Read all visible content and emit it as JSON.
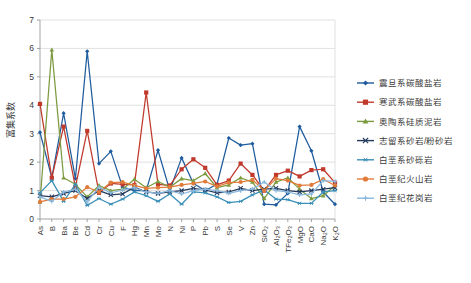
{
  "chart_data": {
    "type": "line",
    "title": "",
    "xlabel": "",
    "ylabel": "富集系数",
    "ylim": [
      0,
      7
    ],
    "ytick_labels": [
      "0",
      "1",
      "2",
      "3",
      "4",
      "5",
      "6",
      "7"
    ],
    "grid": true,
    "legend_position": "right",
    "categories": [
      "As",
      "B",
      "Ba",
      "Be",
      "Cd",
      "Cr",
      "Cu",
      "F",
      "Hg",
      "Mn",
      "Mo",
      "N",
      "Ni",
      "P",
      "Pb",
      "S",
      "Se",
      "V",
      "Zn",
      "SiO₂",
      "Al₂O₃",
      "TFe₂O₃",
      "MgO",
      "CaO",
      "Na₂O",
      "K₂O"
    ],
    "series": [
      {
        "name": "震旦系碳酸盐岩",
        "color": "#1F5C9E",
        "marker": "diamond",
        "values": [
          3.05,
          1.45,
          3.72,
          1.42,
          5.9,
          1.95,
          2.38,
          1.12,
          1.0,
          1.0,
          2.42,
          1.0,
          2.15,
          1.25,
          1.0,
          1.22,
          2.85,
          2.6,
          2.65,
          0.52,
          0.5,
          0.9,
          3.25,
          2.4,
          0.95,
          0.52
        ]
      },
      {
        "name": "寒武系碳酸盐岩",
        "color": "#C0392B",
        "marker": "square",
        "values": [
          4.05,
          1.45,
          3.25,
          1.12,
          3.1,
          0.92,
          1.25,
          1.22,
          1.2,
          4.45,
          1.22,
          1.18,
          1.75,
          2.1,
          1.8,
          1.2,
          1.35,
          1.95,
          1.55,
          1.0,
          1.55,
          1.7,
          1.5,
          1.72,
          1.75,
          1.28
        ]
      },
      {
        "name": "奥陶系硅质泥岩",
        "color": "#7C9B3F",
        "marker": "triangle",
        "values": [
          0.6,
          5.95,
          1.45,
          1.22,
          0.78,
          1.18,
          1.0,
          1.05,
          1.4,
          1.1,
          1.32,
          1.12,
          1.42,
          1.35,
          1.6,
          1.1,
          1.2,
          1.45,
          1.3,
          0.72,
          1.3,
          1.45,
          1.05,
          0.72,
          0.82,
          1.18
        ]
      },
      {
        "name": "志留系砂岩/粉砂岩",
        "color": "#23395D",
        "marker": "cross",
        "values": [
          0.82,
          0.78,
          0.9,
          1.0,
          0.72,
          1.0,
          0.85,
          0.88,
          1.12,
          0.95,
          0.9,
          0.95,
          1.0,
          1.08,
          1.02,
          0.92,
          0.95,
          1.08,
          1.0,
          1.05,
          1.08,
          1.0,
          0.95,
          1.0,
          1.05,
          1.1
        ]
      },
      {
        "name": "白垩系砂砾岩",
        "color": "#3A8FB7",
        "marker": "star",
        "values": [
          0.92,
          1.35,
          0.62,
          1.22,
          0.48,
          0.72,
          0.52,
          0.7,
          0.95,
          0.82,
          0.62,
          0.88,
          0.52,
          0.95,
          0.92,
          0.78,
          0.58,
          0.62,
          0.85,
          1.02,
          0.7,
          0.68,
          0.55,
          0.55,
          0.95,
          1.0
        ]
      },
      {
        "name": "白垩纪火山岩",
        "color": "#E07B39",
        "marker": "circle",
        "values": [
          0.6,
          0.7,
          0.7,
          0.78,
          1.12,
          0.95,
          1.28,
          1.3,
          1.18,
          1.08,
          1.1,
          1.12,
          1.2,
          1.25,
          1.32,
          1.15,
          1.28,
          1.3,
          1.38,
          1.0,
          1.42,
          1.35,
          1.18,
          1.2,
          1.4,
          1.18
        ]
      },
      {
        "name": "白垩纪花岗岩",
        "color": "#8AB8DD",
        "marker": "plus",
        "values": [
          0.78,
          0.62,
          0.95,
          1.05,
          0.6,
          1.12,
          0.92,
          1.02,
          1.1,
          0.95,
          0.9,
          1.0,
          0.88,
          1.0,
          1.05,
          1.0,
          0.9,
          1.0,
          1.05,
          1.3,
          1.0,
          0.95,
          0.85,
          0.88,
          1.35,
          1.32
        ]
      }
    ]
  }
}
